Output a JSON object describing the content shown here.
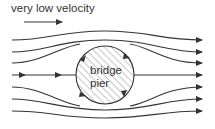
{
  "diagram": {
    "title": "very low velocity",
    "pier_label_line1": "bridge",
    "pier_label_line2": "pier",
    "colors": {
      "line": "#333333",
      "hatch": "#666666",
      "background": "#ffffff"
    },
    "elements": {
      "velocity_arrow": "right-arrow",
      "streamlines_count": 7,
      "obstacle": "circle (hatched)",
      "circulation_arrows": 4
    }
  }
}
